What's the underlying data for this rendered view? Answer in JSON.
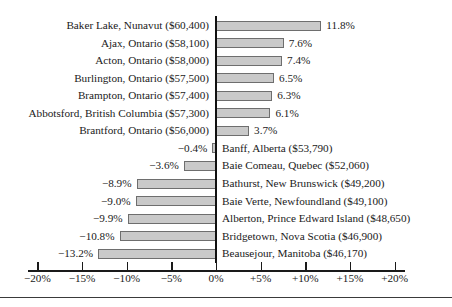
{
  "chart_data": {
    "type": "bar",
    "orientation": "horizontal",
    "title": "",
    "xlabel": "",
    "ylabel": "",
    "xlim": [
      -20,
      20
    ],
    "xticks": [
      "−20%",
      "−15%",
      "−10%",
      "−5%",
      "0%",
      "+5%",
      "+10%",
      "+15%",
      "+20%"
    ],
    "xtick_values": [
      -20,
      -15,
      -10,
      -5,
      0,
      5,
      10,
      15,
      20
    ],
    "grid": false,
    "legend": "none",
    "bar_color": "#c9c9c9",
    "bar_border_color": "#6e6e6e",
    "axis_color": "#111111",
    "categories": [
      "Baker Lake, Nunavut ($60,400)",
      "Ajax, Ontario ($58,100)",
      "Acton, Ontario ($58,000)",
      "Burlington, Ontario ($57,500)",
      "Brampton, Ontario ($57,400)",
      "Abbotsford, British Columbia ($57,300)",
      "Brantford, Ontario ($56,000)",
      "Banff, Alberta ($53,790)",
      "Baie Comeau, Quebec ($52,060)",
      "Bathurst, New Brunswick ($49,200)",
      "Baie Verte, Newfoundland ($49,100)",
      "Alberton, Prince Edward Island ($48,650)",
      "Bridgetown, Nova Scotia ($46,900)",
      "Beausejour, Manitoba ($46,170)"
    ],
    "values": [
      11.8,
      7.6,
      7.4,
      6.5,
      6.3,
      6.1,
      3.7,
      -0.4,
      -3.6,
      -8.9,
      -9.0,
      -9.9,
      -10.8,
      -13.2
    ],
    "value_labels": [
      "11.8%",
      "7.6%",
      "7.4%",
      "6.5%",
      "6.3%",
      "6.1%",
      "3.7%",
      "−0.4%",
      "−3.6%",
      "−8.9%",
      "−9.0%",
      "−9.9%",
      "−10.8%",
      "−13.2%"
    ]
  },
  "rows": [
    {
      "label": "Baker Lake, Nunavut ($60,400)",
      "value": 11.8,
      "value_label": "11.8%",
      "sign": "pos"
    },
    {
      "label": "Ajax, Ontario ($58,100)",
      "value": 7.6,
      "value_label": "7.6%",
      "sign": "pos"
    },
    {
      "label": "Acton, Ontario ($58,000)",
      "value": 7.4,
      "value_label": "7.4%",
      "sign": "pos"
    },
    {
      "label": "Burlington, Ontario ($57,500)",
      "value": 6.5,
      "value_label": "6.5%",
      "sign": "pos"
    },
    {
      "label": "Brampton, Ontario ($57,400)",
      "value": 6.3,
      "value_label": "6.3%",
      "sign": "pos"
    },
    {
      "label": "Abbotsford, British Columbia ($57,300)",
      "value": 6.1,
      "value_label": "6.1%",
      "sign": "pos"
    },
    {
      "label": "Brantford, Ontario ($56,000)",
      "value": 3.7,
      "value_label": "3.7%",
      "sign": "pos"
    },
    {
      "label": "Banff, Alberta ($53,790)",
      "value": -0.4,
      "value_label": "−0.4%",
      "sign": "neg"
    },
    {
      "label": "Baie Comeau, Quebec ($52,060)",
      "value": -3.6,
      "value_label": "−3.6%",
      "sign": "neg"
    },
    {
      "label": "Bathurst, New Brunswick ($49,200)",
      "value": -8.9,
      "value_label": "−8.9%",
      "sign": "neg"
    },
    {
      "label": "Baie Verte, Newfoundland ($49,100)",
      "value": -9.0,
      "value_label": "−9.0%",
      "sign": "neg"
    },
    {
      "label": "Alberton, Prince Edward Island ($48,650)",
      "value": -9.9,
      "value_label": "−9.9%",
      "sign": "neg"
    },
    {
      "label": "Bridgetown, Nova Scotia ($46,900)",
      "value": -10.8,
      "value_label": "−10.8%",
      "sign": "neg"
    },
    {
      "label": "Beausejour, Manitoba ($46,170)",
      "value": -13.2,
      "value_label": "−13.2%",
      "sign": "neg"
    }
  ],
  "axis": {
    "ticks": [
      {
        "label": "−20%",
        "value": -20
      },
      {
        "label": "−15%",
        "value": -15
      },
      {
        "label": "−10%",
        "value": -10
      },
      {
        "label": "−5%",
        "value": -5
      },
      {
        "label": "0%",
        "value": 0
      },
      {
        "label": "+5%",
        "value": 5
      },
      {
        "label": "+10%",
        "value": 10
      },
      {
        "label": "+15%",
        "value": 15
      },
      {
        "label": "+20%",
        "value": 20
      }
    ]
  }
}
